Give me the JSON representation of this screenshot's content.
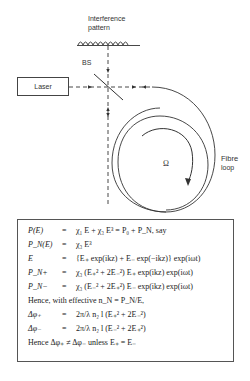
{
  "diagram": {
    "labels": {
      "interference": "Interference",
      "pattern": "pattern",
      "bs": "BS",
      "laser": "Laser",
      "omega": "Ω",
      "fibre": "Fibre",
      "loop": "loop"
    },
    "line_color": "#333333"
  },
  "equations": {
    "rows": [
      {
        "lhs": "P(E)",
        "eq": "=",
        "rhs": "χ₁ E + χ₃ E³ = P₀ + P_N, say"
      },
      {
        "lhs": "P_N(E)",
        "eq": "=",
        "rhs": "χ₃ E³"
      },
      {
        "lhs": "E",
        "eq": "=",
        "rhs": "{E₊ exp(ikz) + E₋ exp(−ikz)} exp(iωt)"
      },
      {
        "lhs": "P_N+",
        "eq": "=",
        "rhs": "χ₃ (E₊² + 2E₋²) E₊ exp(ikz) exp(iωt)"
      },
      {
        "lhs": "P_N−",
        "eq": "=",
        "rhs": "χ₃ (E₋² + 2E₊²) E₋ exp(ikz) exp(iωt)"
      },
      {
        "full": "Hence, with effective n_N = P_N/E,"
      },
      {
        "lhs": "Δφ₊",
        "eq": "=",
        "rhs": "2π/λ n₂ l (E₊² + 2E₋²)"
      },
      {
        "lhs": "Δφ₋",
        "eq": "=",
        "rhs": "2π/λ n₂ l (E₋² + 2E₊²)"
      },
      {
        "full": "Hence Δφ₊ ≠ Δφ₋  unless  E₊ = E₋"
      }
    ]
  }
}
